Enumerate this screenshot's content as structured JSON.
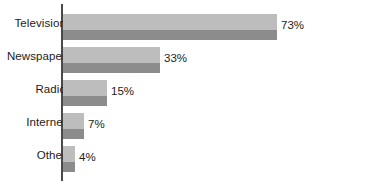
{
  "chart_data": {
    "type": "bar",
    "orientation": "horizontal",
    "title": "",
    "subtitle": "",
    "xlabel": "",
    "ylabel": "",
    "categories": [
      "Television",
      "Newspaper",
      "Radio",
      "Internet",
      "Other"
    ],
    "values": [
      73,
      33,
      15,
      7,
      4
    ],
    "value_labels": [
      "73%",
      "33%",
      "15%",
      "7%",
      "4%"
    ],
    "units": "percent",
    "xlim": [
      0,
      100
    ],
    "grid": false,
    "legend": false,
    "axis_line": "vertical-left",
    "colors": {
      "bar_light": "#bdbdbd",
      "bar_dark": "#8c8c8c",
      "axis": "#4a4a4a",
      "text": "#1c1c1c",
      "background": "#ffffff"
    }
  },
  "bars": [
    {
      "category": "Television",
      "value": 73,
      "label": "73%"
    },
    {
      "category": "Newspaper",
      "value": 33,
      "label": "33%"
    },
    {
      "category": "Radio",
      "value": 15,
      "label": "15%"
    },
    {
      "category": "Internet",
      "value": 7,
      "label": "7%"
    },
    {
      "category": "Other",
      "value": 4,
      "label": "4%"
    }
  ]
}
